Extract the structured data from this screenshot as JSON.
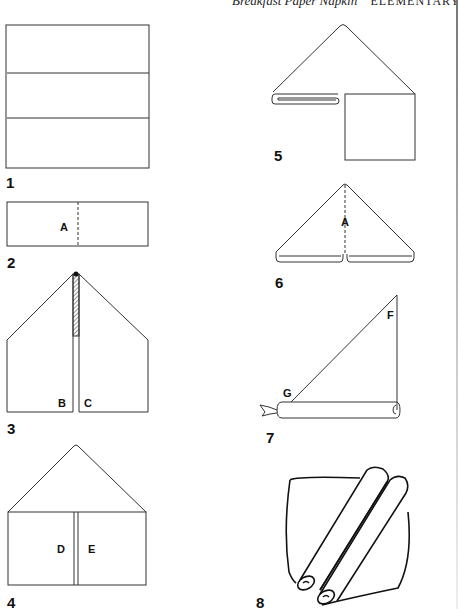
{
  "header": {
    "title": "Breakfast Paper Napkin",
    "level": "ELEMENTARY"
  },
  "steps": [
    {
      "number": "1",
      "labels": []
    },
    {
      "number": "2",
      "labels": [
        "A"
      ]
    },
    {
      "number": "3",
      "labels": [
        "B",
        "C"
      ]
    },
    {
      "number": "4",
      "labels": [
        "D",
        "E"
      ]
    },
    {
      "number": "5",
      "labels": []
    },
    {
      "number": "6",
      "labels": [
        "A"
      ]
    },
    {
      "number": "7",
      "labels": [
        "F",
        "G"
      ]
    },
    {
      "number": "8",
      "labels": []
    }
  ],
  "colors": {
    "line": "#333333",
    "background": "#ffffff"
  }
}
